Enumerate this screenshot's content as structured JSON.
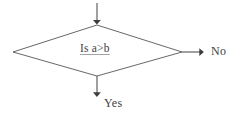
{
  "diagram": {
    "type": "flowchart",
    "background_color": "#ffffff",
    "line_color": "#4a4a4a",
    "text_color": "#3f3f3f",
    "width": 241,
    "height": 118,
    "nodes": [
      {
        "id": "decision",
        "shape": "diamond",
        "label": "Is a>b",
        "underlined": true,
        "center": [
          97,
          51
        ],
        "top_vertex": [
          97,
          25
        ],
        "right_vertex": [
          182,
          52
        ],
        "bottom_vertex": [
          97,
          76
        ],
        "left_vertex": [
          13,
          52
        ]
      }
    ],
    "edges": [
      {
        "id": "edge-in",
        "label": "",
        "direction": "down",
        "from": [
          97,
          3
        ],
        "to": [
          97,
          25
        ],
        "arrowhead": "filled-triangle"
      },
      {
        "id": "edge-no",
        "label": "No",
        "direction": "right",
        "from": [
          182,
          52
        ],
        "to": [
          205,
          52
        ],
        "arrowhead": "filled-triangle",
        "label_position": [
          211,
          45
        ]
      },
      {
        "id": "edge-yes",
        "label": "Yes",
        "direction": "down",
        "from": [
          97,
          76
        ],
        "to": [
          97,
          98
        ],
        "arrowhead": "filled-triangle",
        "label_position": [
          104,
          97
        ]
      }
    ]
  }
}
